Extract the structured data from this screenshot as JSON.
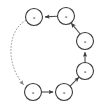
{
  "diagram": {
    "background_color": "#ffffff",
    "node_stroke_color": "#3a3a3a",
    "node_fill_color": "#ffffff",
    "edge_color": "#4a4a4a",
    "dotted_edge_color": "#9a9a9a",
    "label_color": "#2b2b2b",
    "nodes": [
      {
        "id": "n1",
        "label": "a",
        "cx": 34,
        "cy": 17,
        "r": 8.5
      },
      {
        "id": "n2",
        "label": "a",
        "cx": 66,
        "cy": 16,
        "r": 8.5
      },
      {
        "id": "n3",
        "label": "a",
        "cx": 85,
        "cy": 41,
        "r": 8.5
      },
      {
        "id": "n4",
        "label": "a",
        "cx": 85,
        "cy": 71,
        "r": 8.5
      },
      {
        "id": "n5",
        "label": "a",
        "cx": 64,
        "cy": 92,
        "r": 8.5
      },
      {
        "id": "n6",
        "label": "a",
        "cx": 33,
        "cy": 92,
        "r": 8.5
      }
    ],
    "edges": [
      {
        "id": "e1",
        "from": "n6",
        "to": "n5",
        "style": "solid",
        "arrow": true
      },
      {
        "id": "e2",
        "from": "n5",
        "to": "n4",
        "style": "solid",
        "arrow": true
      },
      {
        "id": "e3",
        "from": "n4",
        "to": "n3",
        "style": "solid",
        "arrow": true
      },
      {
        "id": "e4",
        "from": "n3",
        "to": "n2",
        "style": "solid",
        "arrow": true
      },
      {
        "id": "e5",
        "from": "n2",
        "to": "n1",
        "style": "solid",
        "arrow": true
      },
      {
        "id": "e6",
        "from": "n1",
        "to": "n6",
        "style": "dotted",
        "arrow": true
      }
    ]
  }
}
